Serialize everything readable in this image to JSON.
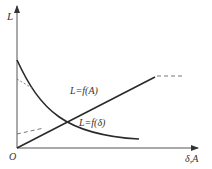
{
  "diagram": {
    "y_axis_label": "L",
    "x_axis_label": "δ,A",
    "origin_label": "O",
    "curves": [
      {
        "name": "increasing",
        "label": "L=f(A)"
      },
      {
        "name": "decreasing",
        "label": "L=f(δ)"
      }
    ],
    "colors": {
      "line": "#2a2a2a",
      "axis": "#555555",
      "dash": "#666666"
    }
  }
}
